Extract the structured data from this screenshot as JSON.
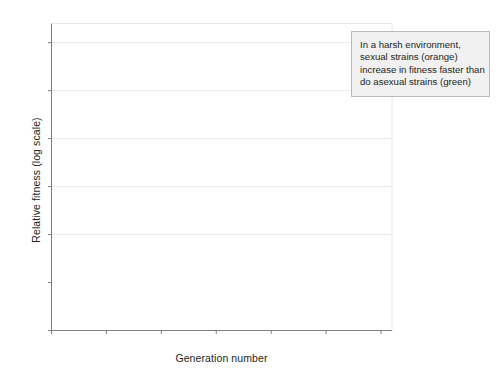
{
  "chart_data": {
    "type": "scatter",
    "title": "",
    "xlabel": "Generation number",
    "ylabel": "Relative fitness (log scale)",
    "xlim": [
      0,
      310
    ],
    "ylim": [
      -0.2,
      1.08
    ],
    "xticks": [
      0,
      50,
      100,
      150,
      200,
      250,
      300
    ],
    "xtick_labels": [
      "0",
      "50",
      "100",
      "150",
      "200",
      "250",
      "300"
    ],
    "yticks": [
      -0.2,
      0,
      0.2,
      0.4,
      0.6,
      0.8,
      1.0
    ],
    "ytick_labels": [
      "−0.2",
      "0",
      "0.2",
      "0.4",
      "0.6",
      "0.8",
      "1.0"
    ],
    "grid": "horizontal",
    "legend_position": "none",
    "zero_line": 0,
    "colors": {
      "sexual": "#8a8a8a",
      "asexual": "#4a4a4a",
      "grid": "#e8e8e8",
      "axis": "#7d7d7d",
      "callout_bg": "#f1f1f1",
      "callout_border": "#b9b9b9",
      "text": "#231f20"
    },
    "series": [
      {
        "name": "sexual strains (orange)",
        "color": "#8a8a8a",
        "fit_curve": {
          "model": "hyperbolic",
          "description": "rises steeply from origin to about 0.67 at generation 290",
          "points": [
            [
              0,
              0
            ],
            [
              10,
              0.072
            ],
            [
              20,
              0.132
            ],
            [
              30,
              0.183
            ],
            [
              40,
              0.227
            ],
            [
              50,
              0.265
            ],
            [
              60,
              0.299
            ],
            [
              70,
              0.329
            ],
            [
              80,
              0.356
            ],
            [
              90,
              0.381
            ],
            [
              100,
              0.403
            ],
            [
              120,
              0.442
            ],
            [
              140,
              0.476
            ],
            [
              160,
              0.505
            ],
            [
              180,
              0.531
            ],
            [
              200,
              0.554
            ],
            [
              220,
              0.575
            ],
            [
              240,
              0.594
            ],
            [
              260,
              0.611
            ],
            [
              280,
              0.627
            ],
            [
              292,
              0.636
            ]
          ]
        },
        "points": [
          [
            22,
            0.262,
            0.015
          ],
          [
            43,
            0.305,
            0.032
          ],
          [
            44,
            0.262,
            0.03
          ],
          [
            45,
            0.33,
            0.04
          ],
          [
            46,
            0.248,
            0.022
          ],
          [
            47,
            0.082,
            0.018
          ],
          [
            48,
            0.052,
            0.03
          ],
          [
            49,
            0.018,
            0.04
          ],
          [
            50,
            0.145,
            0.028
          ],
          [
            64,
            0.356,
            0.02
          ],
          [
            66,
            0.424,
            0.082
          ],
          [
            67,
            0.28,
            0.035
          ],
          [
            68,
            0.133,
            0.022
          ],
          [
            70,
            0.25,
            0.02
          ],
          [
            72,
            0.245,
            0.018
          ],
          [
            74,
            0.1,
            0.018
          ],
          [
            76,
            0.076,
            0.015
          ],
          [
            88,
            0.372,
            0.04
          ],
          [
            90,
            0.442,
            0.02
          ],
          [
            92,
            0.258,
            0.028
          ],
          [
            95,
            0.246,
            0.022
          ],
          [
            98,
            0.352,
            0.018
          ],
          [
            100,
            0.452,
            0.012
          ],
          [
            110,
            0.478,
            0.022
          ],
          [
            112,
            0.438,
            0.028
          ],
          [
            113,
            0.43,
            0.03
          ],
          [
            114,
            0.35,
            0.022
          ],
          [
            116,
            0.5,
            0.015
          ],
          [
            120,
            0.44,
            0.018
          ],
          [
            122,
            0.5,
            0.012
          ],
          [
            128,
            0.536,
            0.028
          ],
          [
            130,
            0.56,
            0.036
          ],
          [
            131,
            0.545,
            0.03
          ],
          [
            133,
            0.515,
            0.026
          ],
          [
            140,
            0.492,
            0.03
          ],
          [
            142,
            0.4,
            0.024
          ],
          [
            148,
            0.305,
            0.03
          ],
          [
            150,
            0.31,
            0.028
          ],
          [
            154,
            0.614,
            0.034
          ],
          [
            156,
            0.64,
            0.026
          ],
          [
            158,
            0.628,
            0.03
          ],
          [
            160,
            0.636,
            0.022
          ],
          [
            163,
            0.712,
            0.018
          ],
          [
            165,
            0.748,
            0.028
          ],
          [
            170,
            0.508,
            0.014
          ],
          [
            175,
            0.604,
            0.012
          ],
          [
            178,
            0.496,
            0.02
          ],
          [
            180,
            0.56,
            0.03
          ],
          [
            182,
            0.556,
            0.026
          ],
          [
            184,
            0.505,
            0.024
          ],
          [
            186,
            0.448,
            0.032
          ],
          [
            190,
            0.844,
            0.07
          ],
          [
            192,
            0.56,
            0.03
          ],
          [
            196,
            0.42,
            0.024
          ],
          [
            205,
            0.695,
            0.03
          ],
          [
            208,
            0.556,
            0.028
          ],
          [
            210,
            0.604,
            0.022
          ],
          [
            212,
            0.745,
            0.034
          ],
          [
            218,
            0.752,
            0.02
          ],
          [
            222,
            0.604,
            0.02
          ],
          [
            226,
            0.61,
            0.024
          ],
          [
            230,
            0.76,
            0.03
          ],
          [
            232,
            0.905,
            0.056
          ],
          [
            233,
            0.8,
            0.026
          ],
          [
            236,
            0.688,
            0.03
          ],
          [
            240,
            0.715,
            0.044
          ],
          [
            242,
            0.52,
            0.026
          ],
          [
            246,
            0.488,
            0.024
          ],
          [
            252,
            0.43,
            0.028
          ],
          [
            258,
            0.62,
            0.026
          ],
          [
            260,
            0.47,
            0.022
          ],
          [
            262,
            0.452,
            0.02
          ],
          [
            264,
            0.708,
            0.022
          ],
          [
            268,
            0.522,
            0.02
          ],
          [
            274,
            0.662,
            0.018
          ],
          [
            276,
            0.548,
            0.02
          ],
          [
            290,
            0.472,
            0.018
          ]
        ]
      },
      {
        "name": "asexual strains (green)",
        "color": "#4a4a4a",
        "fit_curve": {
          "model": "hyperbolic",
          "description": "rises more slowly from origin to about 0.58 at generation 290",
          "points": [
            [
              0,
              0
            ],
            [
              10,
              0.04
            ],
            [
              20,
              0.076
            ],
            [
              30,
              0.109
            ],
            [
              40,
              0.139
            ],
            [
              50,
              0.166
            ],
            [
              60,
              0.192
            ],
            [
              70,
              0.215
            ],
            [
              80,
              0.237
            ],
            [
              90,
              0.258
            ],
            [
              100,
              0.277
            ],
            [
              120,
              0.312
            ],
            [
              140,
              0.343
            ],
            [
              160,
              0.372
            ],
            [
              180,
              0.397
            ],
            [
              200,
              0.421
            ],
            [
              220,
              0.443
            ],
            [
              240,
              0.463
            ],
            [
              260,
              0.481
            ],
            [
              280,
              0.498
            ],
            [
              292,
              0.508
            ]
          ]
        },
        "points": [
          [
            44,
            0.4,
            0.026
          ],
          [
            45,
            0.33,
            0.034
          ],
          [
            46,
            0.3,
            0.026
          ],
          [
            47,
            0.156,
            0.022
          ],
          [
            48,
            0.02,
            0.034
          ],
          [
            49,
            0.012,
            0.03
          ],
          [
            50,
            -0.098,
            0.055
          ],
          [
            51,
            0.142,
            0.026
          ],
          [
            66,
            0.128,
            0.02
          ],
          [
            68,
            0.14,
            0.018
          ],
          [
            74,
            0.062,
            0.014
          ],
          [
            86,
            0.25,
            0.028
          ],
          [
            88,
            0.188,
            0.05
          ],
          [
            90,
            0.262,
            0.022
          ],
          [
            94,
            0.24,
            0.018
          ],
          [
            96,
            0.186,
            0.016
          ],
          [
            112,
            0.432,
            0.02
          ],
          [
            114,
            0.44,
            0.018
          ],
          [
            116,
            0.35,
            0.02
          ],
          [
            118,
            0.29,
            0.016
          ],
          [
            120,
            0.284,
            0.014
          ],
          [
            122,
            0.276,
            0.03
          ],
          [
            132,
            0.398,
            0.022
          ],
          [
            134,
            0.512,
            0.024
          ],
          [
            136,
            0.385,
            0.02
          ],
          [
            140,
            0.398,
            0.024
          ],
          [
            144,
            0.372,
            0.02
          ],
          [
            146,
            0.44,
            0.018
          ],
          [
            150,
            0.452,
            0.02
          ],
          [
            152,
            0.418,
            0.016
          ],
          [
            158,
            0.59,
            0.018
          ],
          [
            176,
            0.34,
            0.008
          ],
          [
            178,
            0.498,
            0.022
          ],
          [
            180,
            0.536,
            0.024
          ],
          [
            182,
            0.5,
            0.02
          ],
          [
            184,
            0.404,
            0.022
          ],
          [
            188,
            0.556,
            0.018
          ],
          [
            194,
            0.464,
            0.018
          ],
          [
            198,
            0.428,
            0.02
          ],
          [
            202,
            0.452,
            0.024
          ],
          [
            206,
            0.536,
            0.018
          ],
          [
            210,
            0.448,
            0.02
          ],
          [
            212,
            0.274,
            0.105
          ],
          [
            216,
            0.56,
            0.016
          ],
          [
            220,
            0.604,
            0.014
          ],
          [
            228,
            0.586,
            0.022
          ],
          [
            232,
            0.75,
            0.028
          ],
          [
            234,
            0.498,
            0.03
          ],
          [
            236,
            0.48,
            0.024
          ],
          [
            244,
            0.432,
            0.018
          ],
          [
            248,
            0.368,
            0.08
          ],
          [
            256,
            0.468,
            0.02
          ],
          [
            258,
            0.446,
            0.022
          ],
          [
            260,
            0.42,
            0.018
          ],
          [
            266,
            0.598,
            0.022
          ],
          [
            272,
            0.54,
            0.02
          ],
          [
            288,
            0.612,
            0.018
          ]
        ]
      }
    ]
  },
  "annotation": {
    "name": "callout",
    "lines": [
      "In a harsh environment,",
      "sexual strains (orange)",
      "increase in fitness faster than",
      "do asexual strains (green)"
    ],
    "target": [
      272,
      0.595
    ]
  }
}
